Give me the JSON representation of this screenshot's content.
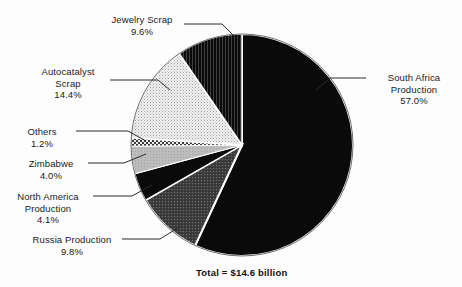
{
  "chart_data": {
    "type": "pie",
    "title": "",
    "subtitle": "",
    "xlabel": "",
    "ylabel": "",
    "legend_position": "none",
    "grid": false,
    "total_label": "Total = $14.6 billion",
    "start_angle_deg": 0,
    "direction": "clockwise",
    "center": {
      "x": 242,
      "y": 145
    },
    "radius": 111,
    "categories": [
      "South Africa Production",
      "Russia Production",
      "North America Production",
      "Zimbabwe",
      "Others",
      "Autocatalyst Scrap",
      "Jewelry Scrap"
    ],
    "values": [
      57.0,
      9.8,
      4.1,
      4.0,
      1.2,
      14.4,
      9.6
    ],
    "units": "percent",
    "slices": [
      {
        "name": "South Africa Production",
        "label_line1": "South Africa",
        "label_line2": "Production",
        "percent_text": "57.0%",
        "value": 57.0,
        "fill": "#0a0a0a",
        "pattern": "solid-black"
      },
      {
        "name": "Russia Production",
        "label_line1": "Russia Production",
        "label_line2": "",
        "percent_text": "9.8%",
        "value": 9.8,
        "fill": "#4a4a4a",
        "pattern": "dark-stipple"
      },
      {
        "name": "North America Production",
        "label_line1": "North America",
        "label_line2": "Production",
        "percent_text": "4.1%",
        "value": 4.1,
        "fill": "#0d0d0d",
        "pattern": "solid-black"
      },
      {
        "name": "Zimbabwe",
        "label_line1": "Zimbabwe",
        "label_line2": "",
        "percent_text": "4.0%",
        "value": 4.0,
        "fill": "#b4b4b4",
        "pattern": "light-gray"
      },
      {
        "name": "Others",
        "label_line1": "Others",
        "label_line2": "",
        "percent_text": "1.2%",
        "value": 1.2,
        "fill": "#8a8a8a",
        "pattern": "checker-hatch"
      },
      {
        "name": "Autocatalyst Scrap",
        "label_line1": "Autocatalyst",
        "label_line2": "Scrap",
        "percent_text": "14.4%",
        "value": 14.4,
        "fill": "#e6e6e6",
        "pattern": "fine-dot-stipple"
      },
      {
        "name": "Jewelry Scrap",
        "label_line1": "Jewelry Scrap",
        "label_line2": "",
        "percent_text": "9.6%",
        "value": 9.6,
        "fill": "#141414",
        "pattern": "dark-vertical-lines"
      }
    ],
    "colors": {
      "background": "#fdfdfd",
      "slice_separator": "#ffffff",
      "outline": "#4d4d4d",
      "text": "#1a1a1a",
      "leader_line": "#2b2b2b"
    }
  }
}
